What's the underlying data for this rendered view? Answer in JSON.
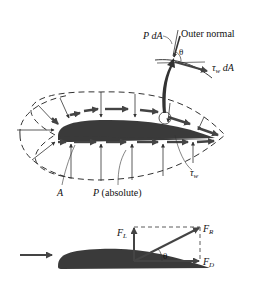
{
  "figure": {
    "top_panel": {
      "labels": {
        "pdA": "P dA",
        "outer_normal": "Outer normal",
        "theta": "θ",
        "tau_w_dA_sym": "τ",
        "tau_w_dA_sub": "w",
        "tau_w_dA_rest": " dA",
        "A": "A",
        "P_abs_sym": "P",
        "P_abs_rest": " (absolute)",
        "tau_w_sym": "τ",
        "tau_w_sub": "w"
      }
    },
    "bottom_panel": {
      "labels": {
        "FL": "F",
        "FL_sub": "L",
        "FR": "F",
        "FR_sub": "R",
        "FD": "F",
        "FD_sub": "D",
        "theta": "θ"
      }
    },
    "colors": {
      "airfoil": "#3a3a3a",
      "lines": "#222222",
      "arrows": "#444444",
      "background": "#ffffff"
    }
  }
}
